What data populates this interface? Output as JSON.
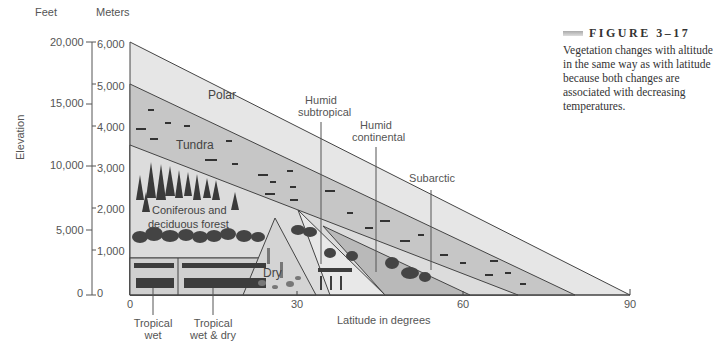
{
  "figure": {
    "label": "FIGURE 3–17",
    "caption": "Vegetation changes with altitude in the same way as with latitude because both changes are associated with decreasing temperatures."
  },
  "axes": {
    "left_unit": "Feet",
    "right_unit": "Meters",
    "y_label": "Elevation",
    "x_label": "Latitude in degrees",
    "feet_ticks": [
      "20,000",
      "15,000",
      "10,000",
      "5,000",
      "0"
    ],
    "meter_ticks": [
      "6,000",
      "5,000",
      "4,000",
      "3,000",
      "2,000",
      "1,000",
      "0"
    ],
    "x_ticks": [
      "0",
      "30",
      "60",
      "90"
    ]
  },
  "zones": {
    "polar": "Polar",
    "tundra": "Tundra",
    "forest_line1": "Coniferous and",
    "forest_line2": "deciduous forest",
    "dry": "Dry"
  },
  "annotations": {
    "humid_subtropical_1": "Humid",
    "humid_subtropical_2": "subtropical",
    "humid_continental_1": "Humid",
    "humid_continental_2": "continental",
    "subarctic": "Subarctic",
    "tropical_wet_1": "Tropical",
    "tropical_wet_2": "wet",
    "tropical_wetdry_1": "Tropical",
    "tropical_wetdry_2": "wet & dry"
  },
  "colors": {
    "polar": "#e6e6e6",
    "tundra": "#c4c4c4",
    "forest": "#dadada",
    "tropical": "#cfcfcf",
    "dry": "#d4d4d4",
    "subtropical": "#e2e2e2",
    "continental": "#b8b8b8",
    "subarctic": "#cccccc",
    "line": "#444444"
  }
}
